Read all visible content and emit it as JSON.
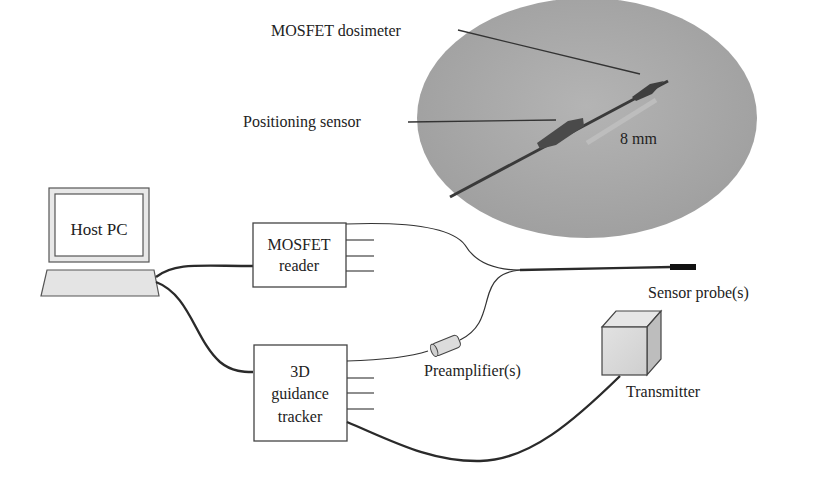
{
  "labels": {
    "mosfet_dosimeter": "MOSFET dosimeter",
    "positioning_sensor": "Positioning sensor",
    "scale": "8 mm",
    "host_pc": "Host PC",
    "mosfet_reader_line1": "MOSFET",
    "mosfet_reader_line2": "reader",
    "tracker_line1": "3D",
    "tracker_line2": "guidance",
    "tracker_line3": "tracker",
    "sensor_probe": "Sensor probe(s)",
    "preamplifier": "Preamplifier(s)",
    "transmitter": "Transmitter"
  },
  "colors": {
    "photo_bg": "#a9a9a9",
    "line": "#2a2a2a",
    "box_fill": "#ffffff",
    "cube_fill": "#d8d8d8"
  }
}
